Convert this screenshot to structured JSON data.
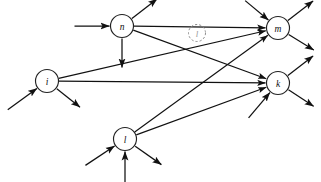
{
  "diagram": {
    "type": "directed-graph",
    "canvas": {
      "width": 321,
      "height": 182,
      "background": "#ffffff"
    },
    "colors": {
      "edge": "#111111",
      "node_stroke": "#222222",
      "node_fill": "#ffffff",
      "ghost_stroke": "#8d8d8d",
      "ghost_label": "#9a9a9a"
    },
    "nodes": [
      {
        "id": "n",
        "label": "n",
        "x": 122,
        "y": 26,
        "r": 11.5,
        "style": "solid"
      },
      {
        "id": "l_ghost",
        "label": "l",
        "x": 197,
        "y": 33,
        "r": 8.5,
        "style": "dashed"
      },
      {
        "id": "m",
        "label": "m",
        "x": 278,
        "y": 28,
        "r": 11.5,
        "style": "solid"
      },
      {
        "id": "i",
        "label": "i",
        "x": 47,
        "y": 81,
        "r": 11.5,
        "style": "solid"
      },
      {
        "id": "k",
        "label": "k",
        "x": 278,
        "y": 83,
        "r": 11.5,
        "style": "solid"
      },
      {
        "id": "l",
        "label": "l",
        "x": 125,
        "y": 139,
        "r": 11.5,
        "style": "solid"
      }
    ],
    "edges": [
      {
        "from": "n",
        "to": "m"
      },
      {
        "from": "n",
        "to": "k"
      },
      {
        "from": "i",
        "to": "m"
      },
      {
        "from": "i",
        "to": "k"
      },
      {
        "from": "l",
        "to": "m"
      },
      {
        "from": "l",
        "to": "k"
      }
    ],
    "stubs": [
      {
        "node": "n",
        "kind": "in",
        "dx": -36,
        "dy": 0
      },
      {
        "node": "n",
        "kind": "out",
        "dx": 26,
        "dy": -20
      },
      {
        "node": "n",
        "kind": "out",
        "dx": 0,
        "dy": 30
      },
      {
        "node": "m",
        "kind": "in",
        "dx": -24,
        "dy": -20
      },
      {
        "node": "m",
        "kind": "out",
        "dx": 26,
        "dy": -20
      },
      {
        "node": "m",
        "kind": "out",
        "dx": 26,
        "dy": 16
      },
      {
        "node": "i",
        "kind": "in",
        "dx": -30,
        "dy": 22
      },
      {
        "node": "i",
        "kind": "out",
        "dx": 24,
        "dy": 19
      },
      {
        "node": "k",
        "kind": "in",
        "dx": -22,
        "dy": 26
      },
      {
        "node": "k",
        "kind": "out",
        "dx": 26,
        "dy": -20
      },
      {
        "node": "k",
        "kind": "out",
        "dx": 26,
        "dy": 17
      },
      {
        "node": "l",
        "kind": "in",
        "dx": -30,
        "dy": 20
      },
      {
        "node": "l",
        "kind": "in",
        "dx": 0,
        "dy": 40
      },
      {
        "node": "l",
        "kind": "out",
        "dx": 27,
        "dy": 19
      }
    ]
  }
}
